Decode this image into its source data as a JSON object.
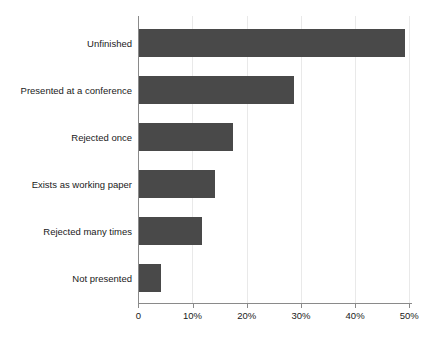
{
  "chart_data": {
    "type": "bar",
    "orientation": "horizontal",
    "title": "",
    "subtitle": "",
    "xlabel": "",
    "ylabel": "",
    "categories": [
      "Unfinished",
      "Presented at a conference",
      "Rejected once",
      "Exists as working paper",
      "Rejected many times",
      "Not presented"
    ],
    "values": [
      49.1,
      28.6,
      17.2,
      14.0,
      11.5,
      4.0
    ],
    "value_unit": "%",
    "xlim": [
      0,
      54
    ],
    "xticks": [
      0,
      10,
      20,
      30,
      40,
      50
    ],
    "xtick_labels": [
      "0",
      "10%",
      "20%",
      "30%",
      "40%",
      "50%"
    ],
    "grid": {
      "vertical": true,
      "horizontal": false,
      "color": "#e9e9e9"
    },
    "legend": {
      "visible": false,
      "position": "none",
      "entries": []
    },
    "annotations": [],
    "colors": {
      "bar_fill": "#494949",
      "background": "#ffffff",
      "axis": "#8a8a8a",
      "gridline": "#e9e9e9",
      "text": "#1a1a1a"
    }
  }
}
